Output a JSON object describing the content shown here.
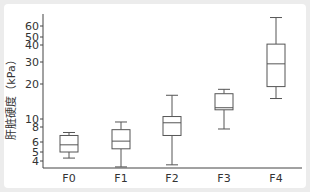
{
  "chart_data": {
    "type": "boxplot",
    "title": "",
    "xlabel": "",
    "ylabel": "肝脏硬度（kPa）",
    "yscale": "log",
    "ylim": [
      3.4,
      70
    ],
    "grid": false,
    "legend": "none",
    "y_ticks": [
      4,
      5,
      6,
      8,
      10,
      20,
      30,
      40,
      50,
      60
    ],
    "y_tick_labels": [
      "4",
      "5",
      "6",
      "8",
      "10",
      "20",
      "30",
      "40",
      "50",
      "60"
    ],
    "categories": [
      "F0",
      "F1",
      "F2",
      "F3",
      "F4"
    ],
    "boxes": [
      {
        "label": "F0",
        "min": 4.3,
        "q1": 5.0,
        "median": 5.7,
        "q3": 6.8,
        "max": 7.2
      },
      {
        "label": "F1",
        "min": 3.4,
        "q1": 5.3,
        "median": 6.1,
        "q3": 7.6,
        "max": 9.2
      },
      {
        "label": "F2",
        "min": 3.6,
        "q1": 6.8,
        "median": 9.0,
        "q3": 10.5,
        "max": 16
      },
      {
        "label": "F3",
        "min": 7.7,
        "q1": 12,
        "median": 12.5,
        "q3": 16.5,
        "max": 18
      },
      {
        "label": "F4",
        "min": 15,
        "q1": 19,
        "median": 29,
        "q3": 41,
        "max": 70
      }
    ],
    "colors": {
      "box_stroke": "#555555",
      "axis": "#444444"
    }
  }
}
